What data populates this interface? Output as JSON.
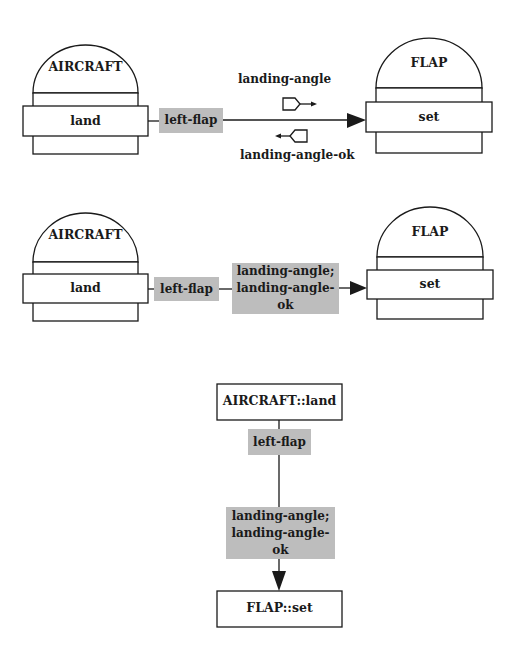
{
  "diagrams": [
    {
      "id": "diagram-1",
      "source": {
        "object": "AIRCRAFT",
        "operation": "land"
      },
      "target": {
        "object": "FLAP",
        "operation": "set"
      },
      "link_label": "left-flap",
      "messages": [
        {
          "label": "landing-angle",
          "direction": "right",
          "icon": "message-flag-right-icon"
        },
        {
          "label": "landing-angle-ok",
          "direction": "left",
          "icon": "message-flag-left-icon"
        }
      ]
    },
    {
      "id": "diagram-2",
      "source": {
        "object": "AIRCRAFT",
        "operation": "land"
      },
      "target": {
        "object": "FLAP",
        "operation": "set"
      },
      "link_label": "left-flap",
      "messages_box": {
        "line1": "landing-angle;",
        "line2": "landing-angle-ok"
      }
    },
    {
      "id": "diagram-3",
      "source_label": "AIRCRAFT::land",
      "link_label": "left-flap",
      "messages_box": {
        "line1": "landing-angle;",
        "line2": "landing-angle-ok"
      },
      "target_label": "FLAP::set"
    }
  ],
  "colors": {
    "line": "#1a1a1a",
    "label_fill": "#bdbdbd",
    "background": "#ffffff"
  }
}
